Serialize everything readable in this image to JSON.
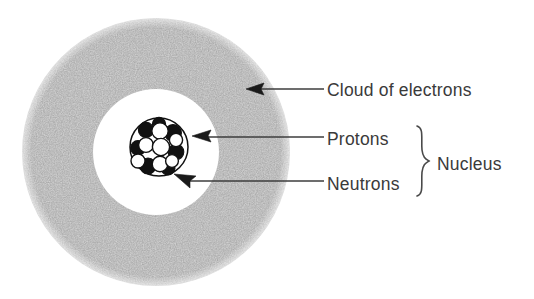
{
  "figure": {
    "background_color": "#ffffff",
    "canvas": {
      "width": 534,
      "height": 299
    }
  },
  "electron_cloud": {
    "name": "electron-cloud-ring",
    "fill_color": "#a8a8a8",
    "texture": "stipple-noise",
    "center": {
      "x": 156,
      "y": 152
    },
    "outer_radius": 134,
    "inner_radius": 63
  },
  "nucleus": {
    "name": "nucleus-cluster",
    "center": {
      "x": 159,
      "y": 147
    },
    "radius": 29,
    "outline_color": "#111111",
    "proton_color": "#111111",
    "neutron_color": "#ffffff",
    "proton_count": 7,
    "neutron_count": 7,
    "protons": [
      {
        "cx": 146,
        "cy": 130,
        "r": 7.6
      },
      {
        "cx": 173,
        "cy": 133,
        "r": 8.4
      },
      {
        "cx": 138,
        "cy": 148,
        "r": 7.4
      },
      {
        "cx": 176,
        "cy": 152,
        "r": 7.8
      },
      {
        "cx": 148,
        "cy": 166,
        "r": 8.0
      },
      {
        "cx": 168,
        "cy": 168,
        "r": 7.0
      },
      {
        "cx": 159,
        "cy": 124,
        "r": 6.6
      }
    ],
    "neutrons": [
      {
        "cx": 160,
        "cy": 131,
        "r": 8.2
      },
      {
        "cx": 146,
        "cy": 145,
        "r": 7.4
      },
      {
        "cx": 161,
        "cy": 147,
        "r": 8.6
      },
      {
        "cx": 176,
        "cy": 140,
        "r": 6.6
      },
      {
        "cx": 138,
        "cy": 161,
        "r": 7.0
      },
      {
        "cx": 160,
        "cy": 164,
        "r": 7.8
      },
      {
        "cx": 172,
        "cy": 161,
        "r": 6.4
      }
    ]
  },
  "labels": {
    "cloud_of_electrons": {
      "text": "Cloud of electrons",
      "x": 327,
      "y": 96
    },
    "protons": {
      "text": "Protons",
      "x": 327,
      "y": 145
    },
    "neutrons": {
      "text": "Neutrons",
      "x": 327,
      "y": 190
    },
    "nucleus": {
      "text": "Nucleus",
      "x": 437,
      "y": 170
    }
  },
  "leaders": {
    "cloud_leader": {
      "name": "cloud-leader-line",
      "from_x": 324,
      "to_x": 250,
      "y": 89,
      "arrow_tip_x": 246,
      "arrow_direction": "left"
    },
    "protons_leader": {
      "name": "protons-leader-line",
      "from_x": 324,
      "to_x": 198,
      "y": 137,
      "arrow_tip_x": 192,
      "arrow_direction": "left"
    },
    "neutrons_leader": {
      "name": "neutrons-leader-line",
      "from_x": 324,
      "to_x": 182,
      "y": 181,
      "arrow_tip_x": 174,
      "arrow_direction": "left-up"
    }
  },
  "brace": {
    "name": "nucleus-brace",
    "x": 423,
    "top_y": 126,
    "bottom_y": 196,
    "stroke_color": "#4a4a4a",
    "groups": [
      "Protons",
      "Neutrons"
    ],
    "label": "Nucleus"
  }
}
